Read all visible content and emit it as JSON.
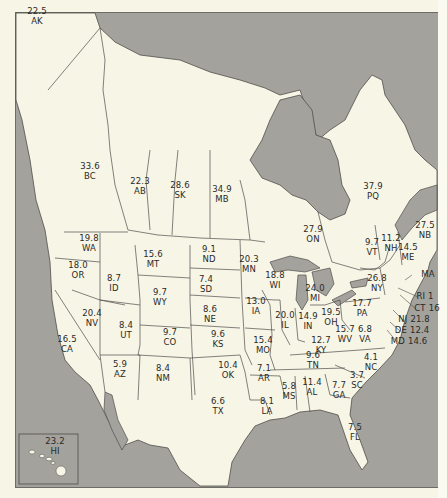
{
  "map": {
    "colors": {
      "land": "#f7f5e6",
      "water": "#a3a29d",
      "border": "#4f4e4a",
      "text": "#2a2a28"
    },
    "regions": [
      {
        "code": "AK",
        "value": "22.5",
        "x": 37,
        "y": 16
      },
      {
        "code": "BC",
        "value": "33.6",
        "x": 90,
        "y": 171
      },
      {
        "code": "AB",
        "value": "22.3",
        "x": 140,
        "y": 186
      },
      {
        "code": "SK",
        "value": "28.6",
        "x": 180,
        "y": 190
      },
      {
        "code": "MB",
        "value": "34.9",
        "x": 222,
        "y": 194
      },
      {
        "code": "PQ",
        "value": "37.9",
        "x": 373,
        "y": 191
      },
      {
        "code": "ON",
        "value": "27.9",
        "x": 313,
        "y": 234
      },
      {
        "code": "NB",
        "value": "27.5",
        "x": 425,
        "y": 230
      },
      {
        "code": "VT",
        "value": "9.7",
        "x": 372,
        "y": 247
      },
      {
        "code": "NH",
        "value": "11.2",
        "x": 391,
        "y": 243
      },
      {
        "code": "ME",
        "value": "14.5",
        "x": 408,
        "y": 252
      },
      {
        "code": "WA",
        "value": "19.8",
        "x": 89,
        "y": 243
      },
      {
        "code": "MT",
        "value": "15.6",
        "x": 153,
        "y": 259
      },
      {
        "code": "ND",
        "value": "9.1",
        "x": 209,
        "y": 254
      },
      {
        "code": "MN",
        "value": "20.3",
        "x": 249,
        "y": 264
      },
      {
        "code": "WI",
        "value": "18.8",
        "x": 275,
        "y": 280
      },
      {
        "code": "MI",
        "value": "24.0",
        "x": 315,
        "y": 293
      },
      {
        "code": "NY",
        "value": "26.8",
        "x": 377,
        "y": 283
      },
      {
        "code": "MA",
        "value": "",
        "x": 428,
        "y": 275
      },
      {
        "code": "OR",
        "value": "18.0",
        "x": 78,
        "y": 270
      },
      {
        "code": "ID",
        "value": "8.7",
        "x": 114,
        "y": 283
      },
      {
        "code": "SD",
        "value": "7.4",
        "x": 206,
        "y": 284
      },
      {
        "code": "WY",
        "value": "9.7",
        "x": 160,
        "y": 297
      },
      {
        "code": "IA",
        "value": "13.0",
        "x": 256,
        "y": 306
      },
      {
        "code": "NE",
        "value": "8.6",
        "x": 210,
        "y": 314
      },
      {
        "code": "IL",
        "value": "20.0",
        "x": 285,
        "y": 320
      },
      {
        "code": "IN",
        "value": "14.9",
        "x": 308,
        "y": 321
      },
      {
        "code": "OH",
        "value": "19.5",
        "x": 331,
        "y": 317
      },
      {
        "code": "PA",
        "value": "17.7",
        "x": 362,
        "y": 308
      },
      {
        "code": "NV",
        "value": "20.4",
        "x": 92,
        "y": 318
      },
      {
        "code": "UT",
        "value": "8.4",
        "x": 126,
        "y": 330
      },
      {
        "code": "CO",
        "value": "9.7",
        "x": 170,
        "y": 337
      },
      {
        "code": "KS",
        "value": "9.6",
        "x": 218,
        "y": 339
      },
      {
        "code": "MO",
        "value": "15.4",
        "x": 263,
        "y": 345
      },
      {
        "code": "KY",
        "value": "12.7",
        "x": 321,
        "y": 345
      },
      {
        "code": "WV",
        "value": "15.7",
        "x": 345,
        "y": 334
      },
      {
        "code": "VA",
        "value": "6.8",
        "x": 365,
        "y": 334
      },
      {
        "code": "CA",
        "value": "16.5",
        "x": 67,
        "y": 344
      },
      {
        "code": "AZ",
        "value": "5.9",
        "x": 120,
        "y": 369
      },
      {
        "code": "NM",
        "value": "8.4",
        "x": 163,
        "y": 373
      },
      {
        "code": "OK",
        "value": "10.4",
        "x": 228,
        "y": 370
      },
      {
        "code": "TN",
        "value": "9.6",
        "x": 313,
        "y": 360
      },
      {
        "code": "NC",
        "value": "4.1",
        "x": 371,
        "y": 362
      },
      {
        "code": "AR",
        "value": "7.1",
        "x": 264,
        "y": 373
      },
      {
        "code": "SC",
        "value": "3.7",
        "x": 357,
        "y": 380
      },
      {
        "code": "MS",
        "value": "5.8",
        "x": 289,
        "y": 391
      },
      {
        "code": "AL",
        "value": "11.4",
        "x": 312,
        "y": 387
      },
      {
        "code": "GA",
        "value": "7.7",
        "x": 339,
        "y": 390
      },
      {
        "code": "LA",
        "value": "8.1",
        "x": 267,
        "y": 406
      },
      {
        "code": "TX",
        "value": "6.6",
        "x": 218,
        "y": 406
      },
      {
        "code": "FL",
        "value": "7.5",
        "x": 355,
        "y": 432
      },
      {
        "code": "HI",
        "value": "23.2",
        "x": 55,
        "y": 446
      }
    ],
    "callouts": [
      {
        "code": "RI",
        "value": "1",
        "x": 425,
        "y": 297
      },
      {
        "code": "CT",
        "value": "16",
        "x": 427,
        "y": 309
      },
      {
        "code": "NJ",
        "value": "21.8",
        "x": 414,
        "y": 320
      },
      {
        "code": "DE",
        "value": "12.4",
        "x": 412,
        "y": 331
      },
      {
        "code": "MD",
        "value": "14.6",
        "x": 409,
        "y": 342
      }
    ]
  }
}
